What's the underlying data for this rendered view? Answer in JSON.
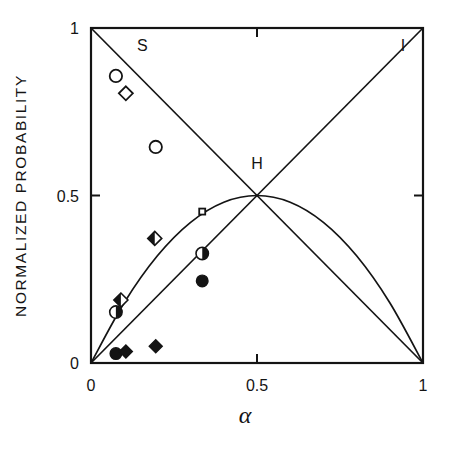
{
  "chart_data": {
    "type": "line",
    "title": "",
    "xlabel": "α",
    "ylabel": "NORMALIZED PROBABILITY",
    "xlim": [
      0,
      1
    ],
    "ylim": [
      0,
      1
    ],
    "xticks": [
      0,
      0.5,
      1
    ],
    "xticklabels": [
      "0",
      "0.5",
      "1"
    ],
    "yticks": [
      0,
      0.5,
      1
    ],
    "yticklabels": [
      "0",
      "0.5",
      "1"
    ],
    "grid": false,
    "legend_position": "inline-curve-labels",
    "annotations": [
      {
        "text": "S",
        "x": 0.155,
        "y": 0.93
      },
      {
        "text": "H",
        "x": 0.5,
        "y": 0.58
      },
      {
        "text": "I",
        "x": 0.94,
        "y": 0.93
      }
    ],
    "series": [
      {
        "name": "S",
        "label": "S",
        "description": "Singlet probability, descending straight line",
        "line_style": "solid",
        "x": [
          0,
          1
        ],
        "values": [
          1,
          0
        ]
      },
      {
        "name": "I",
        "label": "I",
        "description": "Ionic probability, ascending straight line",
        "line_style": "solid",
        "x": [
          0,
          1
        ],
        "values": [
          0,
          1
        ]
      },
      {
        "name": "H",
        "label": "H",
        "description": "Hybrid probability, parabola peaking at 0.5",
        "line_style": "solid",
        "x": [
          0,
          0.1,
          0.2,
          0.3,
          0.4,
          0.5,
          0.6,
          0.7,
          0.8,
          0.9,
          1
        ],
        "values": [
          0,
          0.18,
          0.32,
          0.42,
          0.48,
          0.5,
          0.48,
          0.42,
          0.32,
          0.18,
          0
        ]
      }
    ],
    "data_points": [
      {
        "marker": "open-circle",
        "x": 0.075,
        "y": 0.857,
        "on_curve": "S"
      },
      {
        "marker": "open-diamond",
        "x": 0.105,
        "y": 0.805,
        "on_curve": "S"
      },
      {
        "marker": "open-circle",
        "x": 0.195,
        "y": 0.645,
        "on_curve": "S"
      },
      {
        "marker": "open-square",
        "x": 0.335,
        "y": 0.452,
        "on_curve": "S"
      },
      {
        "marker": "half-diamond",
        "x": 0.192,
        "y": 0.372,
        "on_curve": "H"
      },
      {
        "marker": "half-circle",
        "x": 0.335,
        "y": 0.327,
        "on_curve": "none"
      },
      {
        "marker": "filled-circle",
        "x": 0.335,
        "y": 0.245,
        "on_curve": "none"
      },
      {
        "marker": "half-diamond",
        "x": 0.09,
        "y": 0.188,
        "on_curve": "S"
      },
      {
        "marker": "half-circle",
        "x": 0.075,
        "y": 0.152,
        "on_curve": "S"
      },
      {
        "marker": "filled-circle",
        "x": 0.075,
        "y": 0.028,
        "on_curve": "I"
      },
      {
        "marker": "filled-diamond",
        "x": 0.105,
        "y": 0.034,
        "on_curve": "I"
      },
      {
        "marker": "filled-diamond",
        "x": 0.195,
        "y": 0.05,
        "on_curve": "I"
      }
    ]
  },
  "colors": {
    "ink": "#141414",
    "background": "#ffffff"
  }
}
